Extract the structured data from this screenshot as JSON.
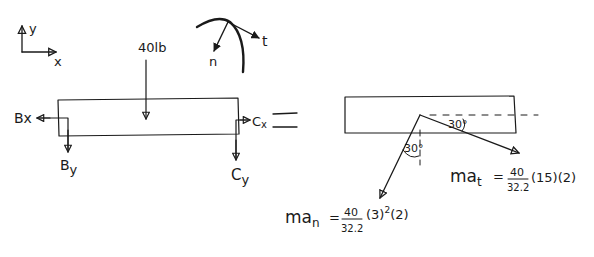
{
  "diagram": {
    "type": "free-body-diagram",
    "ink_color": "#1a1a1a",
    "background": "#ffffff",
    "axes": {
      "x_label": "x",
      "y_label": "y"
    },
    "path_coordinates": {
      "tangent_label": "t",
      "normal_label": "n"
    },
    "fbd": {
      "applied_load": "40lb",
      "reactions": {
        "Bx": "Bx",
        "By_base": "B",
        "By_sub": "y",
        "Cx_base": "C",
        "Cx_sub": "x",
        "Cy_base": "C",
        "Cy_sub": "y"
      }
    },
    "equals_sign": "=",
    "kinetic_diagram": {
      "angle_tangent": "30°",
      "angle_normal": "30°",
      "ma_t": {
        "lhs": "ma",
        "sub": "t",
        "equals": "=",
        "numerator": "40",
        "denominator": "32.2",
        "factors": "(15)(2)"
      },
      "ma_n": {
        "lhs": "ma",
        "sub": "n",
        "equals": "=",
        "numerator": "40",
        "denominator": "32.2",
        "factor1": "(3)",
        "exponent": "2",
        "factor2": "(2)"
      }
    }
  }
}
